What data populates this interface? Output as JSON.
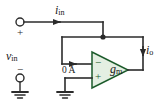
{
  "figure": {
    "kind": "circuit-schematic",
    "background_color": "#ffffff",
    "wire_color": "#2b2b2b",
    "amplifier_fill": "#e4efe2",
    "amplifier_stroke": "#1d5c2c"
  },
  "labels": {
    "i_in": {
      "base": "i",
      "sub": "in"
    },
    "v_in": {
      "base": "v",
      "sub": "in"
    },
    "i_o": {
      "base": "i",
      "sub": "o"
    },
    "zero_amps": "0 A",
    "g_m": {
      "base": "g",
      "sub": "m"
    }
  },
  "signs": {
    "input_positive": "+",
    "input_negative": "−",
    "amp_inverting": "−",
    "amp_noninverting": "+"
  },
  "nodes": {
    "input_terminal_top": "input-terminal-positive",
    "input_terminal_bottom": "input-terminal-negative",
    "feedback_junction": "output-node-junction"
  },
  "symbols": {
    "ground_input": "ground-symbol",
    "ground_amplifier": "ground-symbol"
  }
}
